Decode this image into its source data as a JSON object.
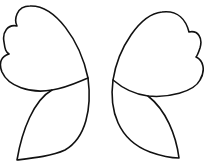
{
  "image": {
    "description": "Line drawing of butterfly wings outline (no body)",
    "background": "#ffffff",
    "stroke_color": "#111111",
    "stroke_width": 1.6
  },
  "wings": {
    "left": {
      "upper": "M88,78 C80,40 55,5 30,6 C16,6 14,20 17,26 C8,24 2,32 4,42 C5,50 6,52 9,54 C2,56 -2,62 2,72 C8,86 30,94 52,90 C66,88 78,82 88,78 Z",
      "lower": "M88,78 C92,108 86,138 65,150 C52,156 34,158 17,160 C22,130 34,100 52,90"
    },
    "right": {
      "upper": "M113,80 C118,48 140,14 162,12 C178,10 186,20 189,32 C198,30 203,38 200,48 C198,54 197,56 196,57 C203,60 206,70 200,80 C194,92 168,98 148,96 C132,94 120,86 113,80 Z",
      "lower": "M113,80 C109,110 118,140 150,152 C164,157 172,158 179,158 C176,135 166,110 148,96"
    }
  }
}
